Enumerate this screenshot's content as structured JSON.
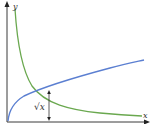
{
  "diagram": {
    "title": "",
    "axes": {
      "x_label": "x",
      "y_label": "y",
      "axis_color": "#3a3a3a"
    },
    "curves": [
      {
        "name": "sqrt-curve",
        "formula": "y = √x",
        "color": "#5b7fd1"
      },
      {
        "name": "reciprocal-curve",
        "formula": "y = 1/x",
        "color": "#6aa84f"
      }
    ],
    "annotation": {
      "label": "√x",
      "description": "vertical double arrow indicating height √x at a chosen x"
    }
  }
}
